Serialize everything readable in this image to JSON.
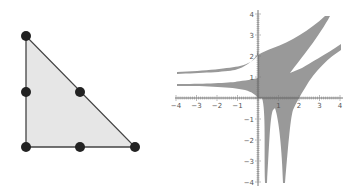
{
  "triangle": {
    "fill": "#e6e6e6",
    "stroke": "#444444",
    "node_color": "#222222",
    "vertices": [
      [
        26,
        36
      ],
      [
        26,
        147
      ],
      [
        135,
        147
      ]
    ],
    "nodes": [
      [
        26,
        36
      ],
      [
        26,
        92
      ],
      [
        80,
        92
      ],
      [
        26,
        147
      ],
      [
        80,
        147
      ],
      [
        135,
        147
      ]
    ]
  },
  "chart_data": {
    "type": "area",
    "title": "",
    "xlabel": "",
    "ylabel": "",
    "xlim": [
      -4,
      4
    ],
    "ylim": [
      -4,
      4
    ],
    "x_ticks": [
      "-4",
      "-3",
      "-2",
      "-1",
      "1",
      "2",
      "3",
      "4"
    ],
    "y_ticks": [
      "4",
      "3",
      "2",
      "1",
      "-1",
      "-2",
      "-3",
      "-4"
    ],
    "grid": false,
    "fill_color": "#999999"
  }
}
